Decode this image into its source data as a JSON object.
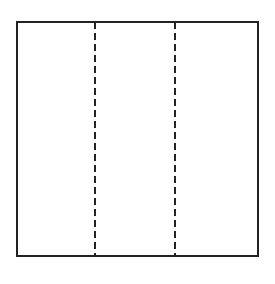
{
  "diagram": {
    "canvas": {
      "width": 275,
      "height": 284,
      "background": "#ffffff"
    },
    "square": {
      "x": 17,
      "y": 22,
      "width": 241,
      "height": 234,
      "stroke": "#222222",
      "stroke_width": 2
    },
    "fold_lines": [
      {
        "x": 95,
        "y1": 22,
        "y2": 256,
        "style": "dashed"
      },
      {
        "x": 175,
        "y1": 22,
        "y2": 256,
        "style": "dashed"
      }
    ],
    "dash_pattern": "7,4",
    "line_color": "#222222"
  }
}
